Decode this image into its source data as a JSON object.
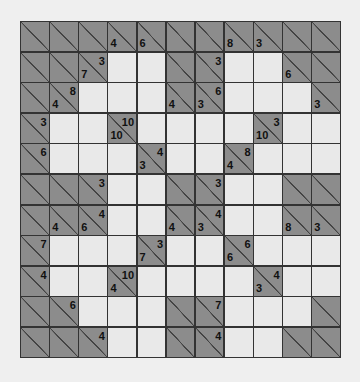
{
  "puzzle": {
    "type": "kakuro",
    "rows": 11,
    "cols": 11,
    "colors": {
      "block": "#8c8c8c",
      "white": "#e9e9e9",
      "grid_line": "#333333",
      "background": "#efefef"
    },
    "grid": [
      [
        {
          "b": 1
        },
        {
          "b": 1
        },
        {
          "b": 1
        },
        {
          "b": 1,
          "d": "4"
        },
        {
          "b": 1,
          "d": "6"
        },
        {
          "b": 1
        },
        {
          "b": 1
        },
        {
          "b": 1,
          "d": "8"
        },
        {
          "b": 1,
          "d": "3"
        },
        {
          "b": 1
        },
        {
          "b": 1
        }
      ],
      [
        {
          "b": 1
        },
        {
          "b": 1
        },
        {
          "b": 1,
          "d": "7",
          "r": "3"
        },
        {
          "b": 0
        },
        {
          "b": 0
        },
        {
          "b": 1
        },
        {
          "b": 1,
          "r": "3"
        },
        {
          "b": 0
        },
        {
          "b": 0
        },
        {
          "b": 1,
          "d": "6"
        },
        {
          "b": 1
        }
      ],
      [
        {
          "b": 1
        },
        {
          "b": 1,
          "d": "4",
          "r": "8"
        },
        {
          "b": 0
        },
        {
          "b": 0
        },
        {
          "b": 0
        },
        {
          "b": 1,
          "d": "4"
        },
        {
          "b": 1,
          "d": "3",
          "r": "6"
        },
        {
          "b": 0
        },
        {
          "b": 0
        },
        {
          "b": 0
        },
        {
          "b": 1,
          "d": "3"
        }
      ],
      [
        {
          "b": 1,
          "r": "3"
        },
        {
          "b": 0
        },
        {
          "b": 0
        },
        {
          "b": 1,
          "d": "10",
          "r": "10"
        },
        {
          "b": 0
        },
        {
          "b": 0
        },
        {
          "b": 0
        },
        {
          "b": 0
        },
        {
          "b": 1,
          "d": "10",
          "r": "3"
        },
        {
          "b": 0
        },
        {
          "b": 0
        }
      ],
      [
        {
          "b": 1,
          "r": "6"
        },
        {
          "b": 0
        },
        {
          "b": 0
        },
        {
          "b": 0
        },
        {
          "b": 1,
          "d": "3",
          "r": "4"
        },
        {
          "b": 0
        },
        {
          "b": 0
        },
        {
          "b": 1,
          "d": "4",
          "r": "8"
        },
        {
          "b": 0
        },
        {
          "b": 0
        },
        {
          "b": 0
        }
      ],
      [
        {
          "b": 1
        },
        {
          "b": 1
        },
        {
          "b": 1,
          "r": "3"
        },
        {
          "b": 0
        },
        {
          "b": 0
        },
        {
          "b": 1
        },
        {
          "b": 1,
          "r": "3"
        },
        {
          "b": 0
        },
        {
          "b": 0
        },
        {
          "b": 1
        },
        {
          "b": 1
        }
      ],
      [
        {
          "b": 1
        },
        {
          "b": 1,
          "d": "4"
        },
        {
          "b": 1,
          "d": "6",
          "r": "4"
        },
        {
          "b": 0
        },
        {
          "b": 0
        },
        {
          "b": 1,
          "d": "4"
        },
        {
          "b": 1,
          "d": "3",
          "r": "4"
        },
        {
          "b": 0
        },
        {
          "b": 0
        },
        {
          "b": 1,
          "d": "8"
        },
        {
          "b": 1,
          "d": "3"
        }
      ],
      [
        {
          "b": 1,
          "r": "7"
        },
        {
          "b": 0
        },
        {
          "b": 0
        },
        {
          "b": 0
        },
        {
          "b": 1,
          "d": "7",
          "r": "3"
        },
        {
          "b": 0
        },
        {
          "b": 0
        },
        {
          "b": 1,
          "d": "6",
          "r": "6"
        },
        {
          "b": 0
        },
        {
          "b": 0
        },
        {
          "b": 0
        }
      ],
      [
        {
          "b": 1,
          "r": "4"
        },
        {
          "b": 0
        },
        {
          "b": 0
        },
        {
          "b": 1,
          "d": "4",
          "r": "10"
        },
        {
          "b": 0
        },
        {
          "b": 0
        },
        {
          "b": 0
        },
        {
          "b": 0
        },
        {
          "b": 1,
          "d": "3",
          "r": "4"
        },
        {
          "b": 0
        },
        {
          "b": 0
        }
      ],
      [
        {
          "b": 1
        },
        {
          "b": 1,
          "r": "6"
        },
        {
          "b": 0
        },
        {
          "b": 0
        },
        {
          "b": 0
        },
        {
          "b": 1
        },
        {
          "b": 1,
          "r": "7"
        },
        {
          "b": 0
        },
        {
          "b": 0
        },
        {
          "b": 0
        },
        {
          "b": 1
        }
      ],
      [
        {
          "b": 1
        },
        {
          "b": 1
        },
        {
          "b": 1,
          "r": "4"
        },
        {
          "b": 0
        },
        {
          "b": 0
        },
        {
          "b": 1
        },
        {
          "b": 1,
          "r": "4"
        },
        {
          "b": 0
        },
        {
          "b": 0
        },
        {
          "b": 1
        },
        {
          "b": 1
        }
      ]
    ]
  }
}
